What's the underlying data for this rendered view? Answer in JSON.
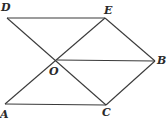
{
  "diagram": {
    "points": {
      "D": {
        "label": "D",
        "x": 7,
        "y": 18,
        "lx": 1,
        "ly": 11
      },
      "E": {
        "label": "E",
        "x": 105,
        "y": 18,
        "lx": 104,
        "ly": 14
      },
      "O": {
        "label": "O",
        "x": 57,
        "y": 60,
        "lx": 49,
        "ly": 75
      },
      "B": {
        "label": "B",
        "x": 155,
        "y": 61,
        "lx": 157,
        "ly": 64
      },
      "A": {
        "label": "A",
        "x": 5,
        "y": 104,
        "lx": 0,
        "ly": 118
      },
      "C": {
        "label": "C",
        "x": 106,
        "y": 105,
        "lx": 102,
        "ly": 116
      }
    },
    "segments": [
      [
        "D",
        "E"
      ],
      [
        "D",
        "C"
      ],
      [
        "A",
        "E"
      ],
      [
        "O",
        "B"
      ],
      [
        "E",
        "B"
      ],
      [
        "B",
        "C"
      ],
      [
        "A",
        "C"
      ]
    ]
  }
}
